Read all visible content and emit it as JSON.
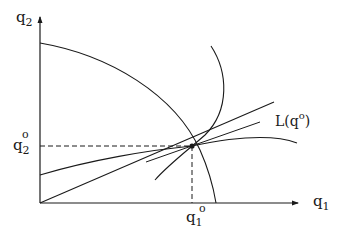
{
  "axes": {
    "x_label": "q",
    "x_sub": "1",
    "y_label": "q",
    "y_sub": "2"
  },
  "point_labels": {
    "q1o_base": "q",
    "q1o_sub": "1",
    "q1o_sup": "o",
    "q2o_base": "q",
    "q2o_sub": "2",
    "q2o_sup": "o"
  },
  "ray_label": {
    "prefix": "L(q",
    "sup": "o",
    "suffix": ")"
  },
  "colors": {
    "ink": "#1a1a1a",
    "background": "#ffffff"
  }
}
